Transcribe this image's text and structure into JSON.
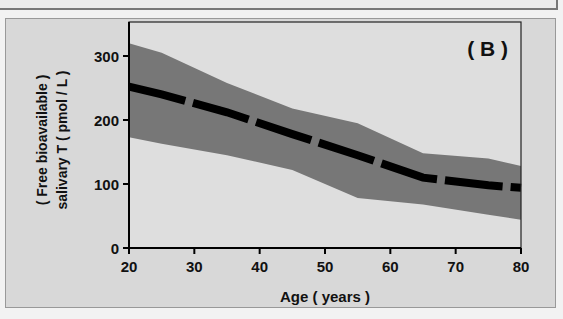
{
  "chart_data": {
    "type": "area",
    "title": "",
    "panel_label": "( B )",
    "xlabel": "Age ( years )",
    "ylabel_line1": "( Free bioavailable )",
    "ylabel_line2": "salivary T ( pmol / L )",
    "xlim": [
      20,
      80
    ],
    "ylim": [
      0,
      340
    ],
    "xticks": [
      20,
      30,
      40,
      50,
      60,
      70,
      80
    ],
    "yticks": [
      0,
      100,
      200,
      300
    ],
    "grid": false,
    "legend": null,
    "x": [
      20,
      25,
      35,
      45,
      55,
      65,
      75,
      80
    ],
    "series": [
      {
        "name": "mean",
        "style": "dashed",
        "color": "#000000",
        "values": [
          252,
          240,
          212,
          178,
          145,
          110,
          98,
          94
        ]
      },
      {
        "name": "upper bound",
        "style": "band-edge",
        "color": "#777777",
        "values": [
          320,
          305,
          258,
          218,
          195,
          148,
          140,
          128
        ]
      },
      {
        "name": "lower bound",
        "style": "band-edge",
        "color": "#777777",
        "values": [
          173,
          163,
          145,
          122,
          78,
          68,
          52,
          44
        ]
      }
    ]
  },
  "colors": {
    "background": "#d8d8d8",
    "band": "#777777",
    "mean_line": "#000000",
    "axis": "#000000"
  }
}
